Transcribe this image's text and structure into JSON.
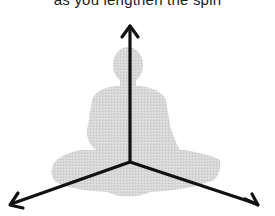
{
  "caption": {
    "text": "as you lengthen the spin"
  },
  "diagram": {
    "figure": "seated-meditation-silhouette",
    "silhouette_color": "#d4d4d4",
    "arrow_color": "#111111",
    "origin": {
      "x": 130,
      "y": 162
    },
    "arrows": [
      {
        "name": "up",
        "tip": {
          "x": 130,
          "y": 26
        }
      },
      {
        "name": "down-left",
        "tip": {
          "x": 10,
          "y": 205
        }
      },
      {
        "name": "down-right",
        "tip": {
          "x": 258,
          "y": 205
        }
      }
    ]
  }
}
